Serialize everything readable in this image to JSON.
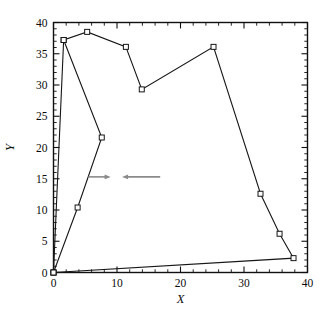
{
  "chart_data": {
    "type": "line",
    "title": "",
    "subtitle": "",
    "xlabel": "X",
    "ylabel": "Y",
    "xlim": [
      0,
      40
    ],
    "ylim": [
      0,
      40
    ],
    "x_ticks": [
      0,
      10,
      20,
      30,
      40
    ],
    "y_ticks": [
      0,
      5,
      10,
      15,
      20,
      25,
      30,
      35,
      40
    ],
    "x_tick_labels": [
      "0",
      "10",
      "20",
      "30",
      "40"
    ],
    "y_tick_labels": [
      "0",
      "5",
      "10",
      "15",
      "20",
      "25",
      "30",
      "35",
      "40"
    ],
    "x_minor_tick_step": 2,
    "y_minor_tick_step": 1,
    "grid": false,
    "legend": null,
    "marker": "open-square",
    "line_color": "#161616",
    "marker_fill": "#ffffff",
    "marker_edge_color": "#161616",
    "series": [
      {
        "name": "closed-contour",
        "closed": true,
        "points": [
          {
            "x": 0.0,
            "y": 0.0
          },
          {
            "x": 1.6,
            "y": 37.2
          },
          {
            "x": 5.3,
            "y": 38.5
          },
          {
            "x": 11.4,
            "y": 36.1
          },
          {
            "x": 13.9,
            "y": 29.3
          },
          {
            "x": 25.2,
            "y": 36.1
          },
          {
            "x": 32.6,
            "y": 12.6
          },
          {
            "x": 35.6,
            "y": 6.2
          },
          {
            "x": 37.8,
            "y": 2.3
          },
          {
            "x": 0.0,
            "y": 0.0
          }
        ]
      },
      {
        "name": "interior-branch",
        "closed": false,
        "points": [
          {
            "x": 1.6,
            "y": 37.2
          },
          {
            "x": 7.6,
            "y": 21.6
          },
          {
            "x": 3.8,
            "y": 10.4
          },
          {
            "x": 0.0,
            "y": 0.0
          }
        ]
      }
    ],
    "annotations": [
      {
        "name": "arrow-right",
        "type": "arrow",
        "direction": "right",
        "color": "#8a8a8a",
        "x_start": 5.5,
        "x_end": 9.0,
        "y": 15.3
      },
      {
        "name": "arrow-left",
        "type": "arrow",
        "direction": "left",
        "color": "#8a8a8a",
        "x_start": 16.8,
        "x_end": 10.8,
        "y": 15.3
      }
    ]
  }
}
